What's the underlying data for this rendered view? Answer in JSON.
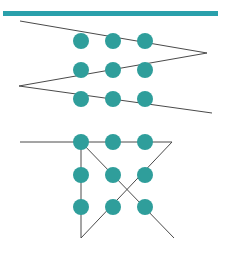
{
  "canvas": {
    "width": 228,
    "height": 255,
    "background": "#ffffff"
  },
  "palette": {
    "teal": "#2f9e9b",
    "teal_dark": "#1f8c8c",
    "bar_teal": "#2aa0ab",
    "line_dark": "#4a4a4a",
    "line_black": "#2b2b2b"
  },
  "header_bar": {
    "name": "top-teal-bar",
    "x": 3,
    "y": 11,
    "width": 215,
    "height": 5,
    "color": "#2aa0ab"
  },
  "figures": [
    {
      "id": "upper-zigzag-figure",
      "label": "zigzag polyline with dot grid",
      "paths": [
        {
          "name": "zigzag-polyline",
          "points": "20,21 207,53 19,86 212,113",
          "stroke": "#4a4a4a",
          "stroke_width": 1
        }
      ],
      "dots": [
        {
          "cx": 81,
          "cy": 41,
          "r": 8
        },
        {
          "cx": 113,
          "cy": 41,
          "r": 8
        },
        {
          "cx": 145,
          "cy": 41,
          "r": 8
        },
        {
          "cx": 81,
          "cy": 70,
          "r": 8
        },
        {
          "cx": 113,
          "cy": 70,
          "r": 8
        },
        {
          "cx": 145,
          "cy": 70,
          "r": 8
        },
        {
          "cx": 81,
          "cy": 99,
          "r": 8
        },
        {
          "cx": 113,
          "cy": 99,
          "r": 8
        },
        {
          "cx": 145,
          "cy": 99,
          "r": 8
        }
      ]
    },
    {
      "id": "lower-crossed-figure",
      "label": "horizontal bar, vertical leg and crossing diagonals with dot grid",
      "paths": [
        {
          "name": "horizontal-top-line",
          "points": "20,142 172,142",
          "stroke": "#4a4a4a",
          "stroke_width": 1
        },
        {
          "name": "vertical-left-line",
          "points": "81,142 81,238",
          "stroke": "#4a4a4a",
          "stroke_width": 1
        },
        {
          "name": "diagonal-down-right",
          "points": "81,142 174,238",
          "stroke": "#4a4a4a",
          "stroke_width": 1
        },
        {
          "name": "diagonal-down-left",
          "points": "172,142 81,238",
          "stroke": "#4a4a4a",
          "stroke_width": 1
        }
      ],
      "dots": [
        {
          "cx": 81,
          "cy": 142,
          "r": 8
        },
        {
          "cx": 113,
          "cy": 142,
          "r": 8
        },
        {
          "cx": 145,
          "cy": 142,
          "r": 8
        },
        {
          "cx": 81,
          "cy": 175,
          "r": 8
        },
        {
          "cx": 113,
          "cy": 175,
          "r": 8
        },
        {
          "cx": 145,
          "cy": 175,
          "r": 8
        },
        {
          "cx": 81,
          "cy": 207,
          "r": 8
        },
        {
          "cx": 113,
          "cy": 207,
          "r": 8
        },
        {
          "cx": 145,
          "cy": 207,
          "r": 8
        }
      ]
    }
  ]
}
